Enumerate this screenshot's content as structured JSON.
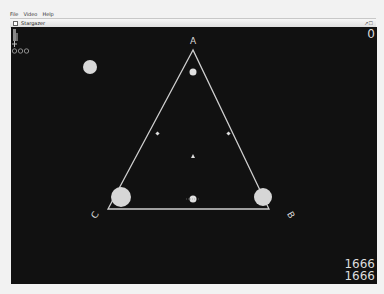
{
  "menu": {
    "items": [
      "File",
      "Video",
      "Help"
    ]
  },
  "window": {
    "title": "Stargazer",
    "controls": "↗☐"
  },
  "game": {
    "score_top": "0",
    "score_bottom_1": "1666",
    "score_bottom_2": "1666",
    "vertices": {
      "a": "A",
      "b": "B",
      "c": "C"
    },
    "colors": {
      "background": "#111111",
      "line": "#cccccc",
      "body": "#d6d6d6"
    }
  }
}
